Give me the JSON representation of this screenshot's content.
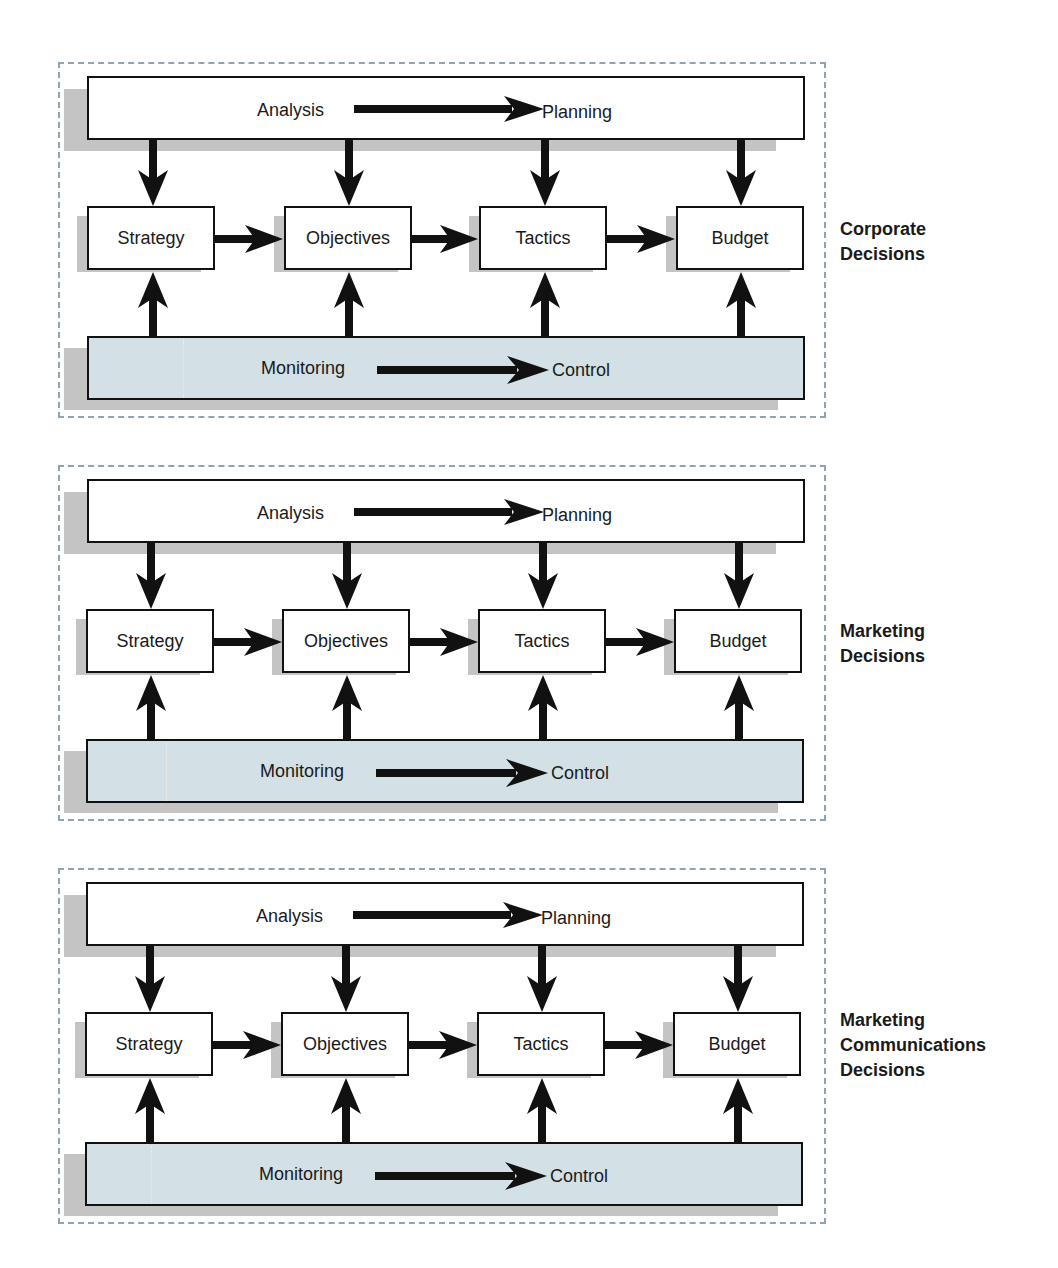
{
  "diagrams": [
    {
      "name": "corporate",
      "label_lines": [
        "Corporate",
        "Decisions"
      ],
      "top_bar": {
        "from": "Analysis",
        "to": "Planning"
      },
      "boxes": [
        "Strategy",
        "Objectives",
        "Tactics",
        "Budget"
      ],
      "bottom_bar": {
        "from": "Monitoring",
        "to": "Control"
      }
    },
    {
      "name": "marketing",
      "label_lines": [
        "Marketing",
        "Decisions"
      ],
      "top_bar": {
        "from": "Analysis",
        "to": "Planning"
      },
      "boxes": [
        "Strategy",
        "Objectives",
        "Tactics",
        "Budget"
      ],
      "bottom_bar": {
        "from": "Monitoring",
        "to": "Control"
      }
    },
    {
      "name": "marketing-communications",
      "label_lines": [
        "Marketing",
        "Communications",
        "Decisions"
      ],
      "top_bar": {
        "from": "Analysis",
        "to": "Planning"
      },
      "boxes": [
        "Strategy",
        "Objectives",
        "Tactics",
        "Budget"
      ],
      "bottom_bar": {
        "from": "Monitoring",
        "to": "Control"
      }
    }
  ],
  "colors": {
    "panel_border": "#8fa3b0",
    "bottom_bar_fill": "#d3e0e6",
    "shadow": "#c4c4c4",
    "stroke": "#111111"
  }
}
